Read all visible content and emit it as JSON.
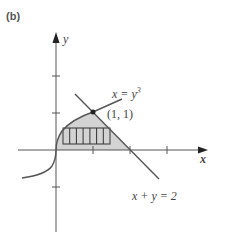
{
  "panel_label": "(b)",
  "axes": {
    "x_label": "x",
    "y_label": "y",
    "origin_px": [
      56,
      150
    ],
    "unit_px": 37,
    "x_ticks": [
      1,
      2,
      3
    ],
    "y_ticks": [
      -1,
      1,
      2
    ]
  },
  "curves": [
    {
      "name": "cubic",
      "equation_lhs": "x = y",
      "equation_exp": "3",
      "color": "#555555"
    },
    {
      "name": "line",
      "equation": "x + y = 2",
      "color": "#555555"
    }
  ],
  "point": {
    "label": "(1, 1)",
    "x": 1,
    "y": 1
  },
  "region": {
    "fill": "#d3d3d3",
    "description": "bounded by x = y^3, x + y = 2, and y = 0"
  },
  "strip": {
    "divisions": 7
  }
}
